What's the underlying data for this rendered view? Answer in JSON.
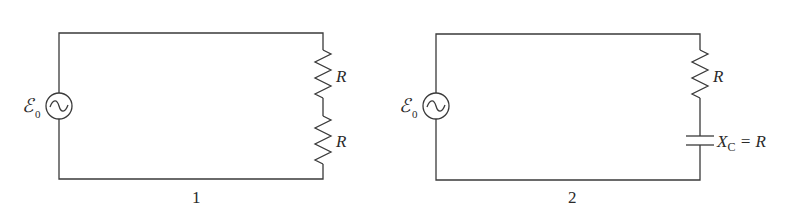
{
  "diagram": {
    "colors": {
      "wire": "#3a3a3a",
      "text": "#2a2a2a",
      "background": "#ffffff"
    },
    "circuits": [
      {
        "id": "1",
        "caption": "1",
        "source": {
          "symbol": "ℰ",
          "subscript": "0",
          "type": "ac-source-icon"
        },
        "components": [
          {
            "type": "resistor",
            "label": "R"
          },
          {
            "type": "resistor",
            "label": "R"
          }
        ]
      },
      {
        "id": "2",
        "caption": "2",
        "source": {
          "symbol": "ℰ",
          "subscript": "0",
          "type": "ac-source-icon"
        },
        "components": [
          {
            "type": "resistor",
            "label": "R"
          },
          {
            "type": "capacitor",
            "label_main": "X",
            "label_sub": "C",
            "label_rest": " = R"
          }
        ]
      }
    ]
  }
}
